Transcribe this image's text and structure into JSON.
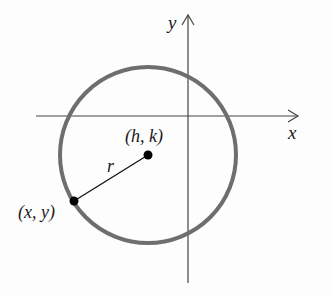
{
  "diagram": {
    "axes": {
      "x_label": "x",
      "y_label": "y",
      "origin_px": [
        188,
        116
      ],
      "x_axis_px": [
        36,
        298
      ],
      "y_axis_px": [
        15,
        283
      ]
    },
    "circle": {
      "center_px": [
        148,
        155
      ],
      "radius_px": 88,
      "stroke_color": "#6e6e6e"
    },
    "points": [
      {
        "name": "center",
        "label": "(h, k)",
        "px": [
          148,
          155
        ]
      },
      {
        "name": "point-on-circle",
        "label": "(x, y)",
        "px": [
          74,
          201
        ]
      }
    ],
    "radius_label": "r",
    "colors": {
      "axis": "#444444",
      "circle": "#6e6e6e",
      "point": "#000000",
      "text": "#1a1a1a"
    }
  }
}
